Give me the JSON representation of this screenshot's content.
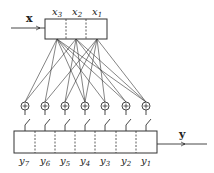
{
  "input": {
    "label": "x",
    "register_cells": [
      "x3",
      "x2",
      "x1"
    ]
  },
  "output": {
    "label": "y",
    "register_cells": [
      "y7",
      "y6",
      "y5",
      "y4",
      "y3",
      "y2",
      "y1"
    ]
  },
  "adders": {
    "count": 7,
    "symbol": "+"
  },
  "colors": {
    "stroke": "#333333",
    "background": "#ffffff"
  }
}
